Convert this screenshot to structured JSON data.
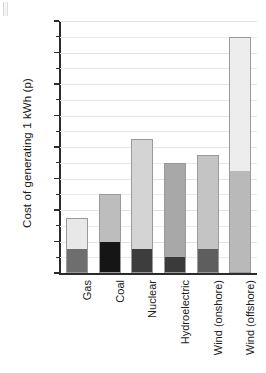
{
  "chart_data": {
    "type": "bar",
    "subtype": "stacked-bar",
    "title": "",
    "xlabel": "",
    "ylabel": "Cost of generating 1 kWh (p)",
    "ylim": [
      0,
      16
    ],
    "yticks": [
      0,
      2,
      4,
      6,
      8,
      10,
      12,
      14,
      16
    ],
    "ytick_labels": [
      "0",
      "2",
      "4",
      "6",
      "8",
      "10",
      "12",
      "14",
      "16"
    ],
    "yminor_ticks": [
      1,
      3,
      5,
      7,
      9,
      11,
      13,
      15
    ],
    "grid": "horizontal",
    "legend": "none",
    "categories": [
      "Gas",
      "Coal",
      "Nuclear",
      "Hydroelectric",
      "Wind (onshore)",
      "Wind (offshore)"
    ],
    "series": [
      {
        "name": "Lower segment",
        "values": [
          1.5,
          2.0,
          1.5,
          1.0,
          1.5,
          6.5
        ]
      },
      {
        "name": "Upper segment",
        "values": [
          2.0,
          3.0,
          7.0,
          6.0,
          6.0,
          8.5
        ]
      }
    ],
    "totals": [
      3.5,
      5.0,
      8.5,
      7.0,
      7.5,
      15.0
    ],
    "bar_colors": [
      {
        "category": "Gas",
        "lower": "#6e6e6e",
        "upper": "#e8e8e8"
      },
      {
        "category": "Coal",
        "lower": "#151515",
        "upper": "#bdbdbd"
      },
      {
        "category": "Nuclear",
        "lower": "#3d3d3d",
        "upper": "#d4d4d4"
      },
      {
        "category": "Hydroelectric",
        "lower": "#3a3a3a",
        "upper": "#a8a8a8"
      },
      {
        "category": "Wind (onshore)",
        "lower": "#5e5e5e",
        "upper": "#c4c4c4"
      },
      {
        "category": "Wind (offshore)",
        "lower": "#b9b9b9",
        "upper": "#ededed"
      }
    ],
    "axis_color": "#2b2b2b",
    "grid_color": "#e9e9e9",
    "bar_outline_color": "#9a9a9a"
  }
}
